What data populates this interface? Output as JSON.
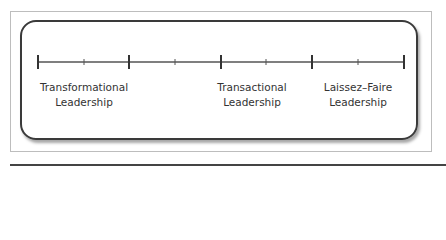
{
  "diagram": {
    "type": "leadership-continuum",
    "colors": {
      "line": "#3a3a3a",
      "frame": "#bdbdbd"
    },
    "scale": {
      "major_ticks_x": [
        38,
        129,
        221,
        312,
        404
      ],
      "minor_ticks_x": [
        84,
        175,
        266,
        358
      ],
      "y": 62
    },
    "labels": [
      {
        "line1": "Transformational",
        "line2": "Leadership"
      },
      {
        "line1": "Transactional",
        "line2": "Leadership"
      },
      {
        "line1": "Laissez–Faire",
        "line2": "Leadership"
      }
    ]
  }
}
